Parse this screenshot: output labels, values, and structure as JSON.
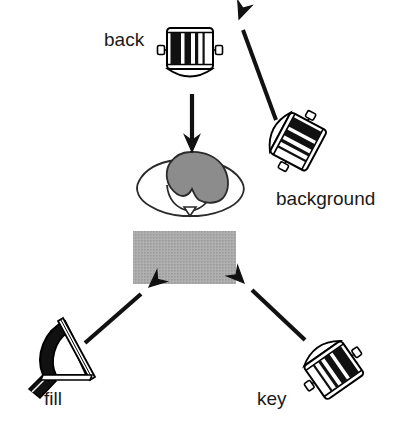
{
  "diagram": {
    "background_color": "#ffffff",
    "ink_color": "#000000",
    "subject": {
      "name": "subject-person",
      "head_color": "#8c8c8c",
      "body_color": "#ffffff",
      "outline_color": "#1a1a1a"
    },
    "table": {
      "name": "table-surface",
      "fill_color": "#a8a8a8",
      "x": 133,
      "y": 231,
      "width": 103,
      "height": 53
    },
    "lights": [
      {
        "id": "back",
        "label": "back",
        "type": "barrel-fresnel",
        "label_x": 104,
        "label_y": 46,
        "fixture_x": 190,
        "fixture_y": 50,
        "rotation": 0,
        "aims_at": "subject"
      },
      {
        "id": "background",
        "label": "background",
        "type": "barrel-fresnel",
        "label_x": 276,
        "label_y": 205,
        "fixture_x": 295,
        "fixture_y": 140,
        "rotation": 118,
        "aims_at": "backdrop"
      },
      {
        "id": "fill",
        "label": "fill",
        "type": "umbrella-reflector",
        "label_x": 44,
        "label_y": 405,
        "fixture_x": 62,
        "fixture_y": 355,
        "rotation": 0,
        "aims_at": "table"
      },
      {
        "id": "key",
        "label": "key",
        "type": "barrel-fresnel",
        "label_x": 257,
        "label_y": 405,
        "fixture_x": 332,
        "fixture_y": 368,
        "rotation": 145,
        "aims_at": "table"
      }
    ],
    "arrows": [
      {
        "id": "arrow-back-to-subject",
        "from": "back",
        "to": "subject",
        "x1": 192,
        "y1": 94,
        "x2": 192,
        "y2": 150,
        "head": "open-chevron"
      },
      {
        "id": "arrow-background-to-backdrop",
        "from": "background",
        "to": "backdrop",
        "x1": 272,
        "y1": 115,
        "x2": 239,
        "y2": 19,
        "head": "open-chevron"
      },
      {
        "id": "arrow-fill-to-table",
        "from": "fill",
        "to": "table",
        "x1": 87,
        "y1": 341,
        "x2": 148,
        "y2": 288,
        "head": "open-chevron"
      },
      {
        "id": "arrow-key-to-table",
        "from": "key",
        "to": "table",
        "x1": 303,
        "y1": 338,
        "x2": 245,
        "y2": 283,
        "head": "open-chevron"
      }
    ]
  }
}
